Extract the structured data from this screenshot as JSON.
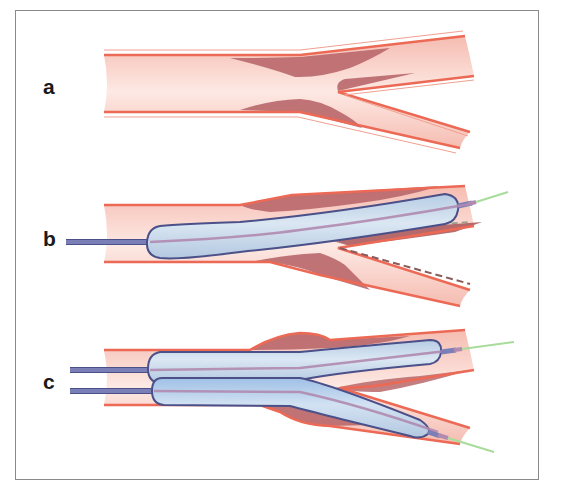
{
  "figure": {
    "colors": {
      "vessel_lumen": "#f7c6bd",
      "vessel_lumen_light": "#fbe3dd",
      "vessel_wall": "#ec6a55",
      "plaque": "#b9676a",
      "plaque_dark": "#a85558",
      "balloon_fill": "#c3d6ea",
      "balloon_outline": "#4b5089",
      "catheter_shaft": "#7a7fb8",
      "guidewire_inner": "#b08ab0",
      "guidewire_tip": "#a8dc9a",
      "dashed_line": "#8a5a5a",
      "frame_border": "#8a8a8a"
    }
  },
  "panels": [
    {
      "label": "a",
      "content": "Bifurcation vessel with atherosclerotic plaque at the carina (main branch and side branch)"
    },
    {
      "label": "b",
      "content": "Single balloon inflated in main branch; plaque shift into side branch ostium (dashed lines)"
    },
    {
      "label": "c",
      "content": "Kissing balloon technique: two balloons inflated simultaneously in main and side branch"
    }
  ]
}
